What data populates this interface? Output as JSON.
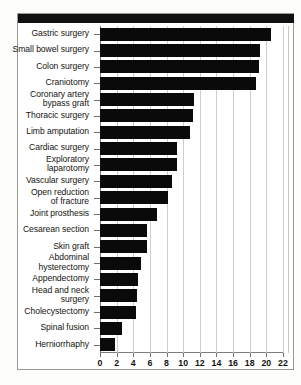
{
  "figure": {
    "title": "",
    "header_band_color": "#111111",
    "bar_color": "#0a0a0a",
    "grid_color": "#cfcfca",
    "axis_color": "#7e7e78"
  },
  "chart_data": {
    "type": "bar",
    "orientation": "horizontal",
    "title": "",
    "subtitle": "",
    "xlabel": "",
    "ylabel": "",
    "xlim": [
      0,
      22
    ],
    "xticks": [
      0,
      2,
      4,
      6,
      8,
      10,
      12,
      14,
      16,
      18,
      20,
      22
    ],
    "xtick_labels": [
      "0",
      "2",
      "4",
      "6",
      "8",
      "10",
      "12",
      "14",
      "16",
      "18",
      "20",
      "22"
    ],
    "grid": true,
    "grid_axis": "x",
    "legend": null,
    "legend_position": "none",
    "annotations": [],
    "categories": [
      "Gastric surgery",
      "Small bowel surgery",
      "Colon surgery",
      "Craniotomy",
      "Coronary artery bypass graft",
      "Thoracic surgery",
      "Limb amputation",
      "Cardiac surgery",
      "Exploratory laparotomy",
      "Vascular surgery",
      "Open reduction of fracture",
      "Joint prosthesis",
      "Cesarean section",
      "Skin graft",
      "Abdominal hysterectomy",
      "Appendectomy",
      "Head and neck surgery",
      "Cholecystectomy",
      "Spinal fusion",
      "Herniorrhaphy"
    ],
    "category_lines": [
      [
        "Gastric surgery"
      ],
      [
        "Small bowel surgery"
      ],
      [
        "Colon surgery"
      ],
      [
        "Craniotomy"
      ],
      [
        "Coronary artery",
        "bypass graft"
      ],
      [
        "Thoracic surgery"
      ],
      [
        "Limb amputation"
      ],
      [
        "Cardiac surgery"
      ],
      [
        "Exploratory",
        "laparotomy"
      ],
      [
        "Vascular surgery"
      ],
      [
        "Open reduction",
        "of fracture"
      ],
      [
        "Joint prosthesis"
      ],
      [
        "Cesarean section"
      ],
      [
        "Skin graft"
      ],
      [
        "Abdominal",
        "hysterectomy"
      ],
      [
        "Appendectomy"
      ],
      [
        "Head and neck",
        "surgery"
      ],
      [
        "Cholecystectomy"
      ],
      [
        "Spinal fusion"
      ],
      [
        "Herniorrhaphy"
      ]
    ],
    "values": [
      20.5,
      19.2,
      19.1,
      18.8,
      11.3,
      11.2,
      10.8,
      9.3,
      9.2,
      8.7,
      8.2,
      6.8,
      5.7,
      5.6,
      4.9,
      4.6,
      4.5,
      4.3,
      2.6,
      1.8
    ]
  }
}
